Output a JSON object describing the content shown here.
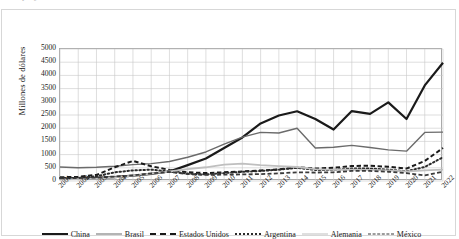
{
  "top_partial_text": "proyectado",
  "chart_data": {
    "type": "line",
    "title": "",
    "xlabel": "",
    "ylabel": "Millones de dólares",
    "ylim": [
      0,
      5000
    ],
    "ytick_step": 500,
    "grid": true,
    "legend_position": "bottom",
    "categories": [
      "2001",
      "2002",
      "2003",
      "2004",
      "2005",
      "2006",
      "2007",
      "2008",
      "2009",
      "2010",
      "2011",
      "2012",
      "2013",
      "2014",
      "2015",
      "2016",
      "2017",
      "2018",
      "2019",
      "2020",
      "2021",
      "2022"
    ],
    "yticks": [
      "0",
      "500",
      "1000",
      "1500",
      "2000",
      "2500",
      "3000",
      "3500",
      "4000",
      "4500",
      "5000"
    ],
    "series": [
      {
        "name": "China",
        "style": "solid",
        "color": "#1a1a1a",
        "width": 2.2,
        "values": [
          80,
          90,
          110,
          150,
          200,
          270,
          360,
          600,
          850,
          1250,
          1650,
          2180,
          2480,
          2640,
          2350,
          1950,
          2650,
          2540,
          2980,
          2350,
          3620,
          4480
        ]
      },
      {
        "name": "Brasil",
        "style": "solid",
        "color": "#6b6b6b",
        "width": 1.4,
        "values": [
          530,
          500,
          520,
          560,
          620,
          660,
          740,
          900,
          1100,
          1400,
          1660,
          1840,
          1820,
          2000,
          1250,
          1280,
          1350,
          1270,
          1180,
          1130,
          1840,
          1850
        ]
      },
      {
        "name": "Estados Unidos",
        "style": "dashed",
        "color": "#1a1a1a",
        "width": 2.0,
        "values": [
          140,
          160,
          230,
          520,
          760,
          560,
          420,
          330,
          300,
          330,
          360,
          400,
          440,
          520,
          470,
          500,
          570,
          580,
          540,
          470,
          760,
          1250
        ]
      },
      {
        "name": "Argentina",
        "style": "dotted",
        "color": "#2b2b2b",
        "width": 2.0,
        "values": [
          110,
          120,
          180,
          330,
          400,
          430,
          360,
          280,
          250,
          300,
          350,
          380,
          430,
          500,
          420,
          420,
          470,
          470,
          430,
          370,
          530,
          900
        ]
      },
      {
        "name": "Alemania",
        "style": "solid",
        "color": "#bfbfbf",
        "width": 1.8,
        "values": [
          60,
          70,
          90,
          140,
          200,
          280,
          360,
          450,
          520,
          620,
          660,
          600,
          560,
          530,
          450,
          420,
          430,
          420,
          400,
          360,
          400,
          430
        ]
      },
      {
        "name": "México",
        "style": "dashed",
        "color": "#3a3a3a",
        "width": 1.8,
        "values": [
          100,
          110,
          130,
          170,
          210,
          290,
          340,
          260,
          230,
          240,
          250,
          260,
          290,
          330,
          320,
          330,
          380,
          380,
          350,
          300,
          210,
          350
        ]
      }
    ]
  }
}
